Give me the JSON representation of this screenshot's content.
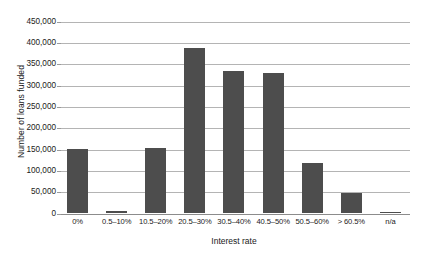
{
  "chart_data": {
    "type": "bar",
    "title": "",
    "xlabel": "Interest rate",
    "ylabel": "Number of loans funded",
    "categories": [
      "0%",
      "0.5–10%",
      "10.5–20%",
      "20.5–30%",
      "30.5–40%",
      "40.5–50%",
      "50.5–60%",
      "> 60.5%",
      "n/a"
    ],
    "values": [
      150000,
      4000,
      152000,
      387000,
      333000,
      327000,
      118000,
      48000,
      1000
    ],
    "ylim": [
      0,
      450000
    ],
    "ytick_labels": [
      "450,000",
      "400,000",
      "350,000",
      "300,000",
      "250,000",
      "200,000",
      "150,000",
      "100,000",
      "50,000",
      "0"
    ],
    "ytick_values": [
      450000,
      400000,
      350000,
      300000,
      250000,
      200000,
      150000,
      100000,
      50000,
      0
    ],
    "grid": true,
    "legend": "none",
    "bar_color": "#4d4d4d",
    "gridline_color": "#b4b4b4",
    "background_color": "#ffffff"
  }
}
